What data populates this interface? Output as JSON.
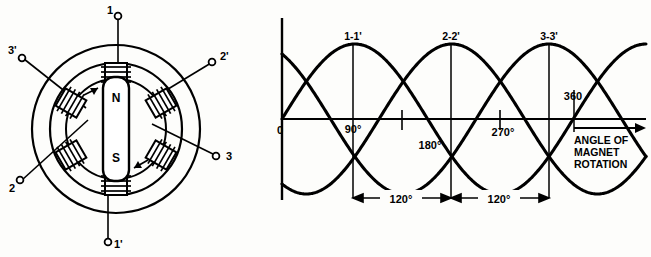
{
  "figure": {
    "background_color": "#fdfdfb",
    "line_color": "#000000"
  },
  "motor": {
    "name": "three-phase-stator-with-rotating-magnet",
    "rotor": {
      "north_label": "N",
      "south_label": "S",
      "rotation_arrows": 2
    },
    "pole_count": 6,
    "terminals": [
      {
        "id": "t1",
        "label": "1",
        "angle_deg": 90,
        "label_x": 107,
        "label_y": 12,
        "dot_x": 118,
        "dot_y": 16
      },
      {
        "id": "t2p",
        "label": "2'",
        "angle_deg": 30,
        "label_x": 222,
        "label_y": 58,
        "dot_x": 212,
        "dot_y": 62
      },
      {
        "id": "t3",
        "label": "3",
        "angle_deg": -30,
        "label_x": 228,
        "label_y": 158,
        "dot_x": 216,
        "dot_y": 156
      },
      {
        "id": "t1p",
        "label": "1'",
        "angle_deg": -90,
        "label_x": 118,
        "label_y": 246,
        "dot_x": 108,
        "dot_y": 242
      },
      {
        "id": "t2",
        "label": "2",
        "angle_deg": 210,
        "label_x": 8,
        "label_y": 188,
        "dot_x": 20,
        "dot_y": 180
      },
      {
        "id": "t3p",
        "label": "3'",
        "angle_deg": 150,
        "label_x": 8,
        "label_y": 52,
        "dot_x": 22,
        "dot_y": 58
      }
    ]
  },
  "chart_data": {
    "type": "line",
    "title": "",
    "xlabel": "ANGLE OF MAGNET ROTATION",
    "ylabel": "",
    "xlim": [
      0,
      450
    ],
    "ylim": [
      -1.25,
      1.25
    ],
    "grid": false,
    "legend": "inline-peak-labels",
    "x_tick_labels": [
      "0",
      "90°",
      "180°",
      "270°",
      "360"
    ],
    "x_tick_values": [
      0,
      90,
      180,
      270,
      360
    ],
    "origin_label": "0",
    "peak_labels": [
      "1-1'",
      "2-2'",
      "3-3'"
    ],
    "peak_label_positions_deg": [
      90,
      210,
      330
    ],
    "dimensions": [
      {
        "label": "120°",
        "from_deg": 90,
        "to_deg": 210
      },
      {
        "label": "120°",
        "from_deg": 210,
        "to_deg": 330
      }
    ],
    "axis_arrow_label_lines": [
      "ANGLE  OF",
      "MAGNET",
      "ROTATION"
    ],
    "series": [
      {
        "name": "1-1'",
        "phase_deg": 0,
        "amplitude": 1,
        "peak_at_deg": 90
      },
      {
        "name": "2-2'",
        "phase_deg": -120,
        "amplitude": 1,
        "peak_at_deg": 210
      },
      {
        "name": "3-3'",
        "phase_deg": -240,
        "amplitude": 1,
        "peak_at_deg": 330
      }
    ]
  }
}
